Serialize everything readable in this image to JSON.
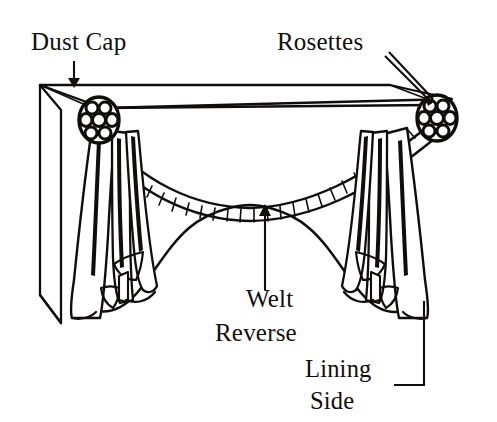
{
  "figure": {
    "background_color": "#ffffff",
    "ink_color": "#100d0d",
    "shade_color": "#8a8a8a"
  },
  "labels": {
    "dust_cap": {
      "text": "Dust Cap",
      "pointer": "down-arrow",
      "x": 31,
      "y": 50
    },
    "rosettes": {
      "text": "Rosettes",
      "pointer": "two-leader-lines",
      "x": 277,
      "y": 50
    },
    "welt_reverse": {
      "line1": "Welt",
      "line2": "Reverse",
      "pointer": "vertical-leader-with-arrow",
      "x": 246,
      "y": 307
    },
    "lining_side": {
      "line1": "Lining",
      "line2": "Side",
      "pointer": "elbow-leader-line",
      "x": 305,
      "y": 377
    }
  },
  "parts": [
    {
      "name": "dust-cap-board",
      "description": "Top mounting board drawn in perspective"
    },
    {
      "name": "left-rosette",
      "description": "Fabric rosette knot at left corner"
    },
    {
      "name": "right-rosette",
      "description": "Fabric rosette knot at right corner"
    },
    {
      "name": "welt-cord",
      "description": "Banded welt cord catenary spanning the swag"
    },
    {
      "name": "swag-body",
      "description": "Lower scalloped swag fabric curve"
    },
    {
      "name": "left-jabot",
      "description": "Left cascading jabot tail with shaded lining"
    },
    {
      "name": "right-jabot",
      "description": "Right cascading jabot tail with shaded lining"
    }
  ]
}
